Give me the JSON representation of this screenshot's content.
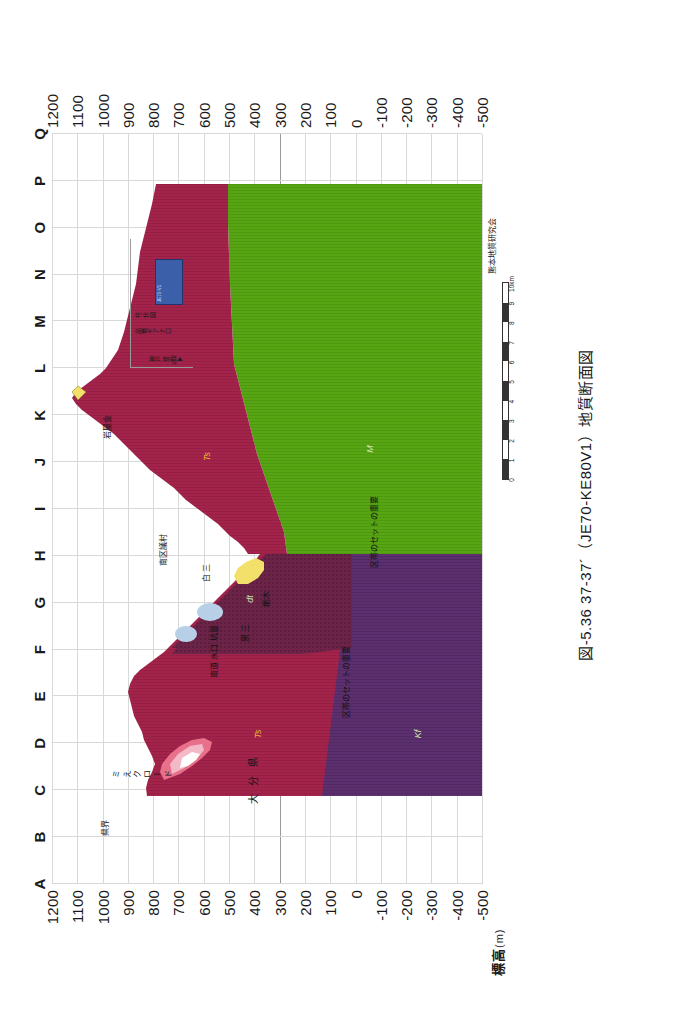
{
  "figure": {
    "caption": "図-5.36  37-37´（JE70-KE80V1）地質断面図",
    "credit": "熊本地質研究会",
    "axis_caption_main": "標高",
    "axis_caption_unit": "(m)"
  },
  "chart_data": {
    "type": "area",
    "title": "図-5.36  37-37´（JE70-KE80V1）地質断面図",
    "xlabel": "",
    "ylabel": "標高(m)",
    "ylim": [
      -500,
      1200
    ],
    "grid": true,
    "legend_position": "top-right",
    "station_labels": [
      "A",
      "B",
      "C",
      "D",
      "E",
      "F",
      "G",
      "H",
      "I",
      "J",
      "K",
      "L",
      "M",
      "N",
      "O",
      "P",
      "Q"
    ],
    "elevation_ticks": [
      "1200",
      "1100",
      "1000",
      "900",
      "800",
      "700",
      "600",
      "500",
      "400",
      "300",
      "200",
      "100",
      "0",
      "-100",
      "-200",
      "-300",
      "-400",
      "-500"
    ],
    "elevation_values": [
      1200,
      1100,
      1000,
      900,
      800,
      700,
      600,
      500,
      400,
      300,
      200,
      100,
      0,
      -100,
      -200,
      -300,
      -400,
      -500
    ],
    "distance_scale_ticks": [
      "0",
      "1",
      "2",
      "3",
      "4",
      "5",
      "6",
      "7",
      "8",
      "9",
      "10km"
    ],
    "distance_scale_values": [
      0,
      1,
      2,
      3,
      4,
      5,
      6,
      7,
      8,
      9,
      10
    ],
    "series": [
      {
        "name": "Ts",
        "color": "#a3234b",
        "description": "主要地質体（赤紫）"
      },
      {
        "name": "M",
        "color": "#57a513",
        "description": "基盤（緑）"
      },
      {
        "name": "Kf",
        "color": "#5c2f6e",
        "description": "深部層（紫）"
      },
      {
        "name": "dt",
        "color": "#6b2448",
        "description": "網掛け部（暗赤紫）"
      },
      {
        "name": "Sn",
        "color": "#b7d0e8",
        "description": "淡青色層"
      },
      {
        "name": "Ys",
        "color": "#f2e06a",
        "description": "黄色層"
      },
      {
        "name": "As",
        "color": "#e8708a",
        "description": "桃色層"
      }
    ],
    "unit_labels": [
      {
        "text": "Ts",
        "x_station": "L",
        "elevation": 620
      },
      {
        "text": "M",
        "x_station": "L",
        "elevation": 0
      },
      {
        "text": "Ts",
        "x_station": "E",
        "elevation": 430
      },
      {
        "text": "Kf",
        "x_station": "E",
        "elevation": -80
      },
      {
        "text": "dt",
        "x_station": "H",
        "elevation": 540
      }
    ]
  },
  "annotations": [
    {
      "id": "kenkai",
      "text": "県界",
      "x_station": "C",
      "elevation": 980
    },
    {
      "id": "oita",
      "text": "大 分 県",
      "x_station": "C",
      "elevation": 410
    },
    {
      "id": "mikuro",
      "text": "ミ\nえ\nク\nロ\nー\nド",
      "x_station": "E",
      "elevation": 840
    },
    {
      "id": "kurosan",
      "text": "黒 三",
      "x_station": "G",
      "elevation": 540
    },
    {
      "id": "suiro",
      "text": "南道\n水口\n坑量",
      "x_station": "G",
      "elevation": 610
    },
    {
      "id": "tochiki",
      "text": "栃木",
      "x_station": "I",
      "elevation": 470
    },
    {
      "id": "kuroyama",
      "text": "白\n三",
      "x_station": "I",
      "elevation": 580
    },
    {
      "id": "nanku",
      "text": "南区議村",
      "x_station": "J",
      "elevation": 540
    },
    {
      "id": "iwayama",
      "text": "岩屋金",
      "x_station": "K",
      "elevation": 840
    },
    {
      "id": "kusetto1",
      "text": "区帯のセットの重要",
      "x_station": "G",
      "elevation": 170
    },
    {
      "id": "kusetto2",
      "text": "区帯のセットの重要",
      "x_station": "J",
      "elevation": 40
    }
  ],
  "legend": {
    "row_1": "神戸 層 群",
    "row_2": "高橋ギアナ口",
    "row_3": "柱 状 図",
    "row_4": "212",
    "swatch_text": "JE70-V1",
    "swatch_color": "#3b5fa8"
  },
  "scale": {
    "note": "",
    "ticks": [
      "0",
      "1",
      "2",
      "3",
      "4",
      "5",
      "6",
      "7",
      "8",
      "9",
      "10km"
    ]
  }
}
